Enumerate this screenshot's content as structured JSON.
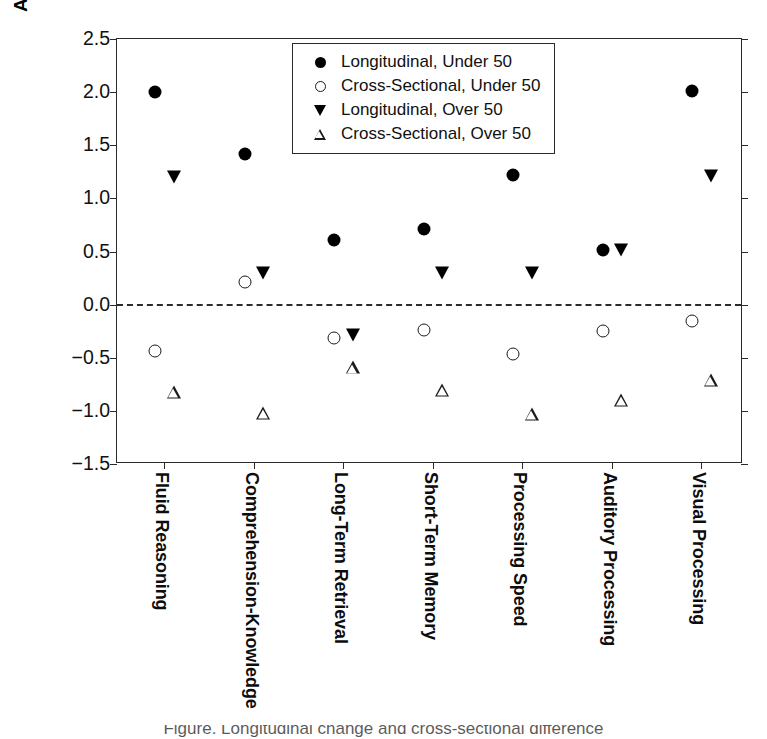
{
  "chart_data": {
    "type": "scatter",
    "title": "",
    "xlabel": "",
    "ylabel": "Annual W-Score Difference/Change",
    "ylim": [
      -1.5,
      2.5
    ],
    "yticks": [
      "2.5",
      "2.0",
      "1.5",
      "1.0",
      "0.5",
      "0.0",
      "-0.5",
      "-1.0",
      "-1.5"
    ],
    "ytick_values": [
      2.5,
      2.0,
      1.5,
      1.0,
      0.5,
      0.0,
      -0.5,
      -1.0,
      -1.5
    ],
    "grid": false,
    "zero_reference_line": 0.0,
    "legend_position": "top-center",
    "categories": [
      "Fluid Reasoning",
      "Comprehension-Knowledge",
      "Long-Term Retrieval",
      "Short-Term Memory",
      "Processing Speed",
      "Auditory Processing",
      "Visual Processing"
    ],
    "series": [
      {
        "name": "Longitudinal, Under 50",
        "marker": "filled-circle",
        "values": [
          2.0,
          1.42,
          0.61,
          0.71,
          1.22,
          0.51,
          2.01
        ]
      },
      {
        "name": "Cross-Sectional, Under 50",
        "marker": "open-circle",
        "values": [
          -0.44,
          0.21,
          -0.31,
          -0.24,
          -0.46,
          -0.25,
          -0.15
        ]
      },
      {
        "name": "Longitudinal, Over 50",
        "marker": "filled-triangle",
        "values": [
          1.2,
          0.3,
          -0.29,
          0.3,
          0.3,
          0.51,
          1.21
        ]
      },
      {
        "name": "Cross-Sectional, Over 50",
        "marker": "open-triangle",
        "values": [
          -0.82,
          -1.02,
          -0.59,
          -0.8,
          -1.03,
          -0.9,
          -0.71
        ]
      }
    ]
  },
  "axis": {
    "y_title": "Annual W-Score Difference/Change"
  },
  "legend": {
    "entries": [
      {
        "marker": "filled-circle",
        "label": "Longitudinal, Under 50"
      },
      {
        "marker": "open-circle",
        "label": "Cross-Sectional, Under 50"
      },
      {
        "marker": "filled-triangle",
        "label": "Longitudinal, Over 50"
      },
      {
        "marker": "open-triangle",
        "label": "Cross-Sectional, Over 50"
      }
    ]
  },
  "caption": {
    "sliver_text": "Figure. Longitudinal change and cross-sectional difference"
  }
}
